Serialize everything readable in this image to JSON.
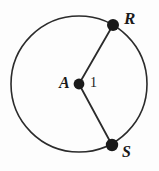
{
  "figure": {
    "kind": "circle-with-two-radii",
    "background_color": "#fdfdfd",
    "stroke_color": "#2b2b2b",
    "point_fill_color": "#1a1a1a",
    "circle": {
      "center_label": "A",
      "center_x": 79,
      "center_y": 84,
      "radius_px": 68,
      "radius_value_label": "1"
    },
    "points": [
      {
        "label": "R",
        "x": 113,
        "y": 25
      },
      {
        "label": "S",
        "x": 112,
        "y": 145
      }
    ],
    "segments": [
      {
        "name": "radius-A-R",
        "from": "A",
        "to": "R"
      },
      {
        "name": "radius-A-S",
        "from": "A",
        "to": "S"
      }
    ],
    "labels": {
      "center": "A",
      "radius_measure": "1",
      "point_upper": "R",
      "point_lower": "S"
    }
  }
}
